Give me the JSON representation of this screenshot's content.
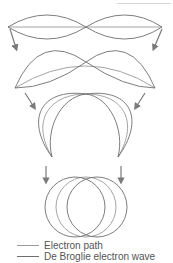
{
  "diagram": {
    "stages": [
      {
        "id": 1,
        "shape": "straight standing wave"
      },
      {
        "id": 2,
        "shape": "bent standing wave"
      },
      {
        "id": 3,
        "shape": "arched standing wave"
      },
      {
        "id": 4,
        "shape": "closed circular orbit"
      }
    ],
    "colors": {
      "electron_path": "#9a9a9a",
      "de_broglie_wave": "#6e6e6e",
      "arrows": "#7a7a7a"
    }
  },
  "legend": {
    "items": [
      {
        "label": "Electron path",
        "color": "#9a9a9a"
      },
      {
        "label": "De Broglie electron wave",
        "color": "#6e6e6e"
      }
    ]
  }
}
